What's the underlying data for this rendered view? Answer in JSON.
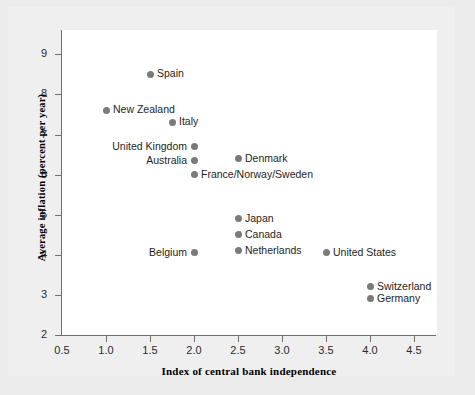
{
  "chart_data": {
    "type": "scatter",
    "title": "",
    "xlabel": "Index of central bank independence",
    "ylabel": "Average inflation (percent per year)",
    "xlim": [
      0.5,
      4.75
    ],
    "ylim": [
      2,
      9.4
    ],
    "xticks": [
      "0.5",
      "1.0",
      "1.5",
      "2.0",
      "2.5",
      "3.0",
      "3.5",
      "4.0",
      "4.5"
    ],
    "xtick_values": [
      0.5,
      1.0,
      1.5,
      2.0,
      2.5,
      3.0,
      3.5,
      4.0,
      4.5
    ],
    "yticks": [
      "2",
      "3",
      "4",
      "5",
      "6",
      "7",
      "8",
      "9"
    ],
    "ytick_values": [
      2,
      3,
      4,
      5,
      6,
      7,
      8,
      9
    ],
    "grid": false,
    "legend": "none",
    "marker_color": "#7a7a7a",
    "points": [
      {
        "label": "Spain",
        "x": 1.5,
        "y": 8.5,
        "label_side": "right"
      },
      {
        "label": "New Zealand",
        "x": 1.0,
        "y": 7.6,
        "label_side": "right"
      },
      {
        "label": "Italy",
        "x": 1.75,
        "y": 7.3,
        "label_side": "right"
      },
      {
        "label": "United Kingdom",
        "x": 2.0,
        "y": 6.7,
        "label_side": "left"
      },
      {
        "label": "Australia",
        "x": 2.0,
        "y": 6.35,
        "label_side": "left"
      },
      {
        "label": "Denmark",
        "x": 2.5,
        "y": 6.4,
        "label_side": "right"
      },
      {
        "label": "France/Norway/Sweden",
        "x": 2.0,
        "y": 6.0,
        "label_side": "right"
      },
      {
        "label": "Japan",
        "x": 2.5,
        "y": 4.9,
        "label_side": "right"
      },
      {
        "label": "Canada",
        "x": 2.5,
        "y": 4.5,
        "label_side": "right"
      },
      {
        "label": "Netherlands",
        "x": 2.5,
        "y": 4.1,
        "label_side": "right"
      },
      {
        "label": "Belgium",
        "x": 2.0,
        "y": 4.05,
        "label_side": "left"
      },
      {
        "label": "United States",
        "x": 3.5,
        "y": 4.05,
        "label_side": "right"
      },
      {
        "label": "Switzerland",
        "x": 4.0,
        "y": 3.2,
        "label_side": "right"
      },
      {
        "label": "Germany",
        "x": 4.0,
        "y": 2.9,
        "label_side": "right"
      }
    ]
  },
  "colors": {
    "background": "#ebebeb",
    "panel": "#ffffff",
    "axis": "#6f6f6f",
    "marker": "#7a7a7a",
    "text": "#1e1e1e"
  }
}
